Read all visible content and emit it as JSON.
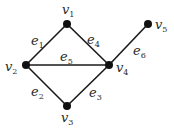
{
  "graph": {
    "vertices": [
      {
        "id": "v1",
        "label": "v",
        "sub": "1",
        "x": 67,
        "y": 24,
        "lx": 62,
        "ly": 14
      },
      {
        "id": "v2",
        "label": "v",
        "sub": "2",
        "x": 26,
        "y": 65,
        "lx": 5,
        "ly": 71
      },
      {
        "id": "v3",
        "label": "v",
        "sub": "3",
        "x": 67,
        "y": 106,
        "lx": 61,
        "ly": 122
      },
      {
        "id": "v4",
        "label": "v",
        "sub": "4",
        "x": 109,
        "y": 65,
        "lx": 116,
        "ly": 72
      },
      {
        "id": "v5",
        "label": "v",
        "sub": "5",
        "x": 148,
        "y": 24,
        "lx": 155,
        "ly": 29
      }
    ],
    "edges": [
      {
        "id": "e1",
        "from": "v2",
        "to": "v1",
        "label": "e",
        "sub": "1",
        "lx": 31,
        "ly": 45
      },
      {
        "id": "e2",
        "from": "v2",
        "to": "v3",
        "label": "e",
        "sub": "2",
        "lx": 31,
        "ly": 96
      },
      {
        "id": "e3",
        "from": "v3",
        "to": "v4",
        "label": "e",
        "sub": "3",
        "lx": 89,
        "ly": 97
      },
      {
        "id": "e4",
        "from": "v1",
        "to": "v4",
        "label": "e",
        "sub": "4",
        "lx": 87,
        "ly": 44
      },
      {
        "id": "e5",
        "from": "v2",
        "to": "v4",
        "label": "e",
        "sub": "5",
        "lx": 60,
        "ly": 61
      },
      {
        "id": "e6",
        "from": "v4",
        "to": "v5",
        "label": "e",
        "sub": "6",
        "lx": 133,
        "ly": 55
      }
    ]
  },
  "colors": {
    "edge": "#1a1a1a",
    "vertex": "#111111",
    "text": "#2a2a2a",
    "background": "#ffffff"
  }
}
